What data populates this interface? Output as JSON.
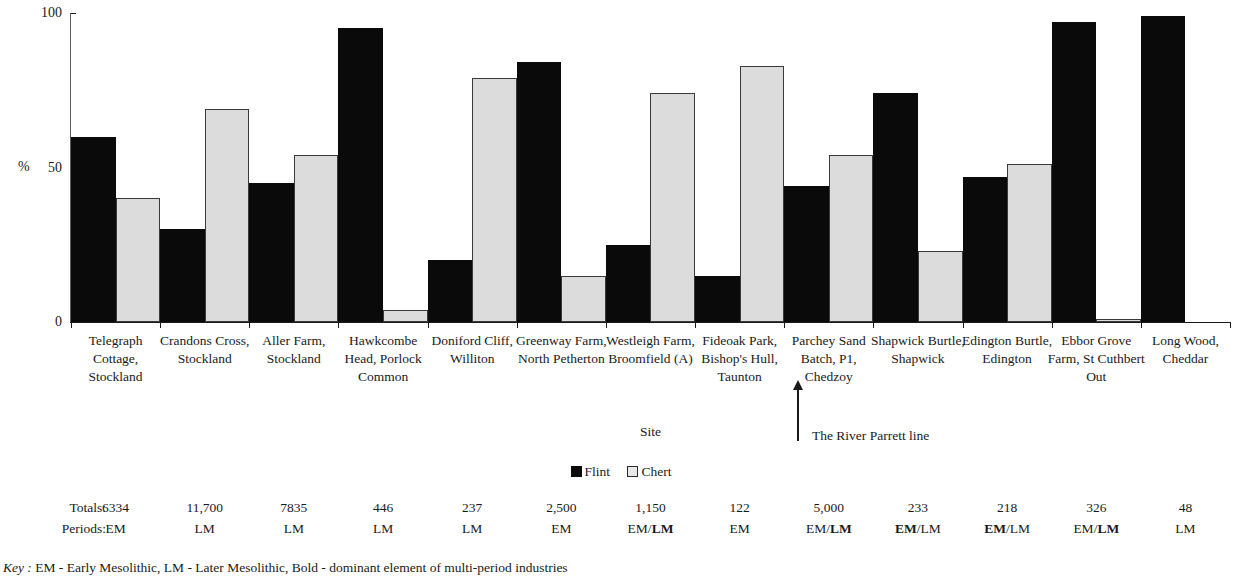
{
  "chart_data": {
    "type": "bar",
    "title": "",
    "xlabel": "Site",
    "ylabel": "%",
    "ylim": [
      0,
      100
    ],
    "yticks": [
      0,
      50,
      100
    ],
    "ytick_labels": [
      "0",
      "50",
      "100"
    ],
    "grid": false,
    "legend_position": "bottom-center",
    "categories": [
      "Telegraph Cottage, Stockland",
      "Crandons Cross, Stockland",
      "Aller Farm, Stockland",
      "Hawkcombe Head, Porlock Common",
      "Doniford Cliff, Williton",
      "Greenway Farm, North Petherton",
      "Westleigh Farm, Broomfield (A)",
      "Fideoak Park, Bishop's Hull, Taunton",
      "Parchey Sand Batch, P1, Chedzoy",
      "Shapwick Burtle, Shapwick",
      "Edington Burtle, Edington",
      "Ebbor Grove Farm, St Cuthbert Out",
      "Long Wood, Cheddar"
    ],
    "series": [
      {
        "name": "Flint",
        "color": "#0a0a0a",
        "values": [
          60,
          30,
          45,
          95,
          20,
          84,
          25,
          15,
          44,
          74,
          47,
          97,
          99
        ]
      },
      {
        "name": "Chert",
        "color": "#dcdcdc",
        "values": [
          40,
          69,
          54,
          4,
          79,
          15,
          74,
          83,
          54,
          23,
          51,
          1,
          0
        ]
      }
    ],
    "annotations": [
      {
        "text": "The River Parrett line",
        "points_to": "Parchey Sand Batch, P1, Chedzoy"
      }
    ]
  },
  "axis": {
    "y_title": "%",
    "x_title": "Site",
    "y_tick_labels": [
      "100",
      "50",
      "0"
    ]
  },
  "legend": {
    "items": [
      {
        "label": "Flint",
        "swatch": "flint-swatch"
      },
      {
        "label": "Chert",
        "swatch": "chert-swatch"
      }
    ]
  },
  "annotation": {
    "river_parrett": "The River Parrett line"
  },
  "table": {
    "row_labels": {
      "totals": "Totals:",
      "periods": "Periods:"
    },
    "columns": [
      {
        "site": "Telegraph Cottage, Stockland",
        "total": "6334",
        "period_parts": [
          {
            "text": "EM",
            "bold": false
          }
        ]
      },
      {
        "site": "Crandons Cross, Stockland",
        "total": "11,700",
        "period_parts": [
          {
            "text": "LM",
            "bold": false
          }
        ]
      },
      {
        "site": "Aller Farm, Stockland",
        "total": "7835",
        "period_parts": [
          {
            "text": "LM",
            "bold": false
          }
        ]
      },
      {
        "site": "Hawkcombe Head, Porlock Common",
        "total": "446",
        "period_parts": [
          {
            "text": "LM",
            "bold": false
          }
        ]
      },
      {
        "site": "Doniford Cliff, Williton",
        "total": "237",
        "period_parts": [
          {
            "text": "LM",
            "bold": false
          }
        ]
      },
      {
        "site": "Greenway Farm, North Petherton",
        "total": "2,500",
        "period_parts": [
          {
            "text": "EM",
            "bold": false
          }
        ]
      },
      {
        "site": "Westleigh Farm, Broomfield (A)",
        "total": "1,150",
        "period_parts": [
          {
            "text": "EM/",
            "bold": false
          },
          {
            "text": "LM",
            "bold": true
          }
        ]
      },
      {
        "site": "Fideoak Park, Bishop's Hull, Taunton",
        "total": "122",
        "period_parts": [
          {
            "text": "EM",
            "bold": false
          }
        ]
      },
      {
        "site": "Parchey Sand Batch, P1, Chedzoy",
        "total": "5,000",
        "period_parts": [
          {
            "text": "EM/",
            "bold": false
          },
          {
            "text": "LM",
            "bold": true
          }
        ]
      },
      {
        "site": "Shapwick Burtle, Shapwick",
        "total": "233",
        "period_parts": [
          {
            "text": "EM",
            "bold": true
          },
          {
            "text": "/LM",
            "bold": false
          }
        ]
      },
      {
        "site": "Edington Burtle, Edington",
        "total": "218",
        "period_parts": [
          {
            "text": "EM",
            "bold": true
          },
          {
            "text": "/LM",
            "bold": false
          }
        ]
      },
      {
        "site": "Ebbor Grove Farm, St Cuthbert Out",
        "total": "326",
        "period_parts": [
          {
            "text": "EM/",
            "bold": false
          },
          {
            "text": "LM",
            "bold": true
          }
        ]
      },
      {
        "site": "Long Wood, Cheddar",
        "total": "48",
        "period_parts": [
          {
            "text": "LM",
            "bold": false
          }
        ]
      }
    ]
  },
  "key": {
    "word": "Key :",
    "text": "EM - Early Mesolithic, LM - Later Mesolithic, Bold - dominant element of multi-period industries"
  },
  "colors": {
    "flint": "#0a0a0a",
    "chert": "#dcdcdc",
    "axis": "#1a1a1a",
    "background": "#ffffff"
  }
}
